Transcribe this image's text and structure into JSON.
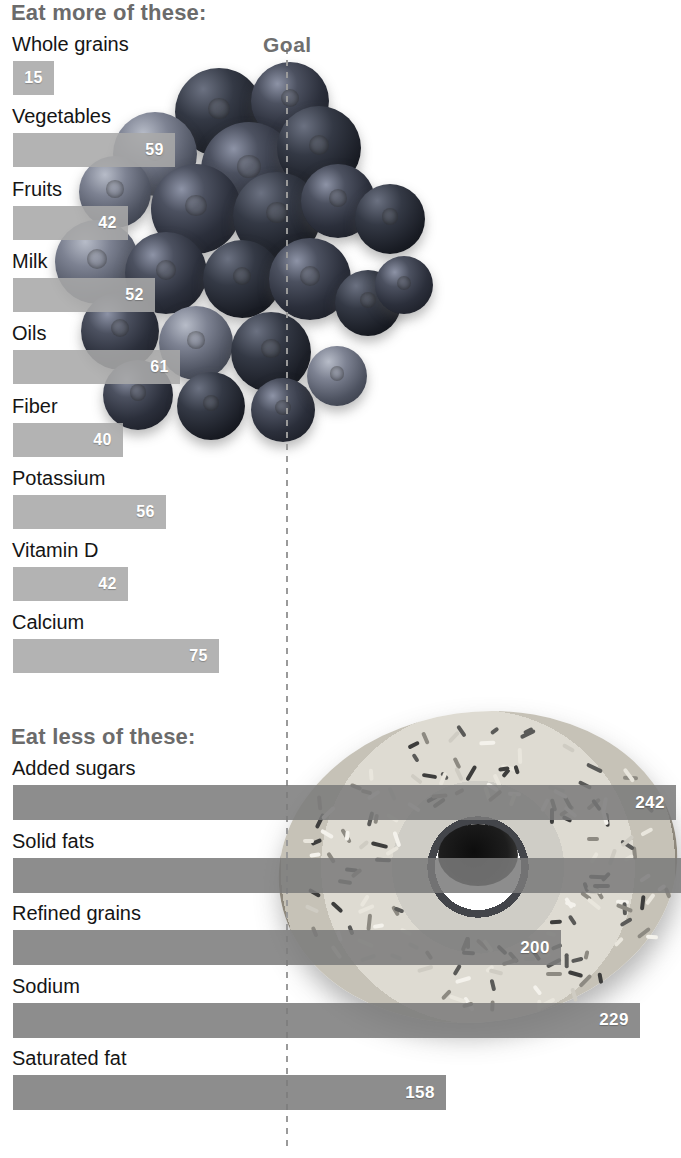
{
  "chart_data": {
    "type": "bar",
    "title": "",
    "orientation": "horizontal",
    "xlabel": "",
    "ylabel": "",
    "reference_line": {
      "label": "Goal",
      "value": 100,
      "style": "dashed"
    },
    "xlim": [
      0,
      250
    ],
    "grid": false,
    "legend": null,
    "units": "percent of goal",
    "sections": [
      {
        "heading": "Eat more of these:",
        "bar_style": "light-gray",
        "categories": [
          "Whole grains",
          "Vegetables",
          "Fruits",
          "Milk",
          "Oils",
          "Fiber",
          "Potassium",
          "Vitamin D",
          "Calcium"
        ],
        "values": [
          15,
          59,
          42,
          52,
          61,
          40,
          56,
          42,
          75
        ],
        "labels": [
          "15",
          "59",
          "42",
          "52",
          "61",
          "40",
          "56",
          "42",
          "75"
        ]
      },
      {
        "heading": "Eat less of these:",
        "bar_style": "dark-gray",
        "categories": [
          "Added sugars",
          "Solid fats",
          "Refined grains",
          "Sodium",
          "Saturated fat"
        ],
        "values": [
          242,
          250,
          200,
          229,
          158
        ],
        "labels": [
          "242",
          "",
          "200",
          "229",
          "158"
        ]
      }
    ]
  },
  "sections": {
    "more": {
      "heading": "Eat more of these:",
      "rows": [
        {
          "label": "Whole grains",
          "value": "15",
          "pct": 15
        },
        {
          "label": "Vegetables",
          "value": "59",
          "pct": 59
        },
        {
          "label": "Fruits",
          "value": "42",
          "pct": 42
        },
        {
          "label": "Milk",
          "value": "52",
          "pct": 52
        },
        {
          "label": "Oils",
          "value": "61",
          "pct": 61
        },
        {
          "label": "Fiber",
          "value": "40",
          "pct": 40
        },
        {
          "label": "Potassium",
          "value": "56",
          "pct": 56
        },
        {
          "label": "Vitamin D",
          "value": "42",
          "pct": 42
        },
        {
          "label": "Calcium",
          "value": "75",
          "pct": 75
        }
      ]
    },
    "less": {
      "heading": "Eat less of these:",
      "rows": [
        {
          "label": "Added sugars",
          "value": "242",
          "pct": 242
        },
        {
          "label": "Solid fats",
          "value": "",
          "pct": 250
        },
        {
          "label": "Refined grains",
          "value": "200",
          "pct": 200
        },
        {
          "label": "Sodium",
          "value": "229",
          "pct": 229
        },
        {
          "label": "Saturated fat",
          "value": "158",
          "pct": 158
        }
      ]
    }
  },
  "goal": {
    "label": "Goal"
  },
  "colors": {
    "bar_more": "#a8a8a8",
    "bar_less": "#7a7a7a",
    "heading": "#6b6b6b",
    "label": "#151515",
    "value_text": "#ffffff",
    "goal_line": "#9a9a9a",
    "background": "#ffffff"
  },
  "photos": [
    {
      "name": "blueberries-photo",
      "alt": "blueberries"
    },
    {
      "name": "donut-photo",
      "alt": "frosted donut with sprinkles"
    }
  ]
}
